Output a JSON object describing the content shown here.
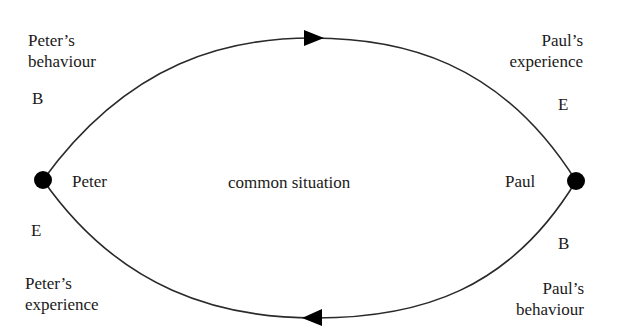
{
  "diagram": {
    "nodes": [
      {
        "id": "peter",
        "label": "Peter"
      },
      {
        "id": "paul",
        "label": "Paul"
      }
    ],
    "center_label": "common situation",
    "top_left": {
      "title_line1": "Peter’s",
      "title_line2": "behaviour",
      "letter": "B"
    },
    "top_right": {
      "title_line1": "Paul’s",
      "title_line2": "experience",
      "letter": "E"
    },
    "bottom_left": {
      "letter": "E",
      "title_line1": "Peter’s",
      "title_line2": "experience"
    },
    "bottom_right": {
      "letter": "B",
      "title_line1": "Paul’s",
      "title_line2": "behaviour"
    },
    "edges": [
      {
        "from": "peter",
        "to": "paul",
        "path": "top arc",
        "arrow_direction": "right"
      },
      {
        "from": "paul",
        "to": "peter",
        "path": "bottom arc",
        "arrow_direction": "left"
      }
    ],
    "colors": {
      "line": "#2a2a2a",
      "node": "#000000",
      "background": "#ffffff"
    }
  }
}
